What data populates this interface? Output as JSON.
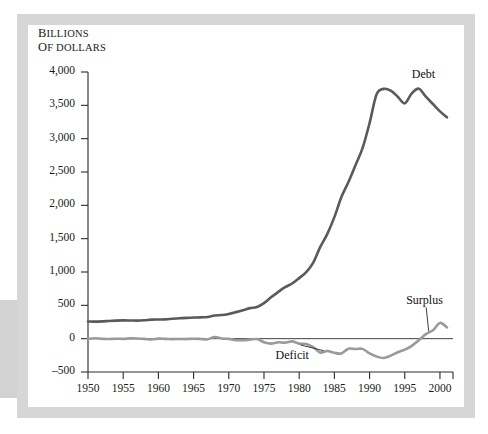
{
  "figure": {
    "frame_color": "#d6d6d6",
    "background_color": "#ffffff"
  },
  "chart_data": {
    "type": "line",
    "title": "",
    "subtitle": "",
    "ylabel_line1": "Billions",
    "ylabel_line2": "of dollars",
    "xlabel": "",
    "ylim": [
      -500,
      4000
    ],
    "xlim": [
      1950,
      2001
    ],
    "yticks": [
      -500,
      0,
      500,
      1000,
      1500,
      2000,
      2500,
      3000,
      3500,
      4000
    ],
    "ytick_labels": [
      "–500",
      "0",
      "500",
      "1,000",
      "1,500",
      "2,000",
      "2,500",
      "3,000",
      "3,500",
      "4,000"
    ],
    "xticks": [
      1950,
      1955,
      1960,
      1965,
      1970,
      1975,
      1980,
      1985,
      1990,
      1995,
      2000
    ],
    "xtick_labels": [
      "1950",
      "1955",
      "1960",
      "1965",
      "1970",
      "1975",
      "1980",
      "1985",
      "1990",
      "1995",
      "2000"
    ],
    "grid": false,
    "legend_position": "inline-annotations",
    "zero_reference_line": true,
    "annotations": [
      {
        "text": "Debt",
        "series": "Debt",
        "at_x": 1996,
        "at_y": 3950,
        "leader": false
      },
      {
        "text": "Surplus",
        "series": "Deficit and Surplus",
        "at_x": 1995.2,
        "at_y": 560,
        "leader": true
      },
      {
        "text": "Deficit",
        "series": "Deficit and Surplus",
        "at_x": 1977.5,
        "at_y": -255,
        "leader": true
      }
    ],
    "series": [
      {
        "name": "Debt",
        "color": "#5c5a58",
        "linewidth": 2.6,
        "x": [
          1950,
          1951,
          1952,
          1953,
          1954,
          1955,
          1956,
          1957,
          1958,
          1959,
          1960,
          1961,
          1962,
          1963,
          1964,
          1965,
          1966,
          1967,
          1968,
          1969,
          1970,
          1971,
          1972,
          1973,
          1974,
          1975,
          1976,
          1977,
          1978,
          1979,
          1980,
          1981,
          1982,
          1983,
          1984,
          1985,
          1986,
          1987,
          1988,
          1989,
          1990,
          1991,
          1992,
          1993,
          1994,
          1995,
          1996,
          1997,
          1998,
          1999,
          2000,
          2001
        ],
        "values": [
          257,
          255,
          259,
          266,
          271,
          274,
          273,
          271,
          276,
          285,
          287,
          289,
          298,
          306,
          312,
          317,
          320,
          326,
          348,
          354,
          371,
          398,
          427,
          458,
          475,
          533,
          620,
          699,
          772,
          827,
          908,
          998,
          1142,
          1377,
          1572,
          1823,
          2125,
          2350,
          2602,
          2857,
          3233,
          3665,
          3747,
          3720,
          3630,
          3530,
          3680,
          3750,
          3630,
          3520,
          3410,
          3320
        ]
      },
      {
        "name": "Deficit and Surplus",
        "color": "#9a9a9a",
        "linewidth": 2.6,
        "x": [
          1950,
          1951,
          1952,
          1953,
          1954,
          1955,
          1956,
          1957,
          1958,
          1959,
          1960,
          1961,
          1962,
          1963,
          1964,
          1965,
          1966,
          1967,
          1968,
          1969,
          1970,
          1971,
          1972,
          1973,
          1974,
          1975,
          1976,
          1977,
          1978,
          1979,
          1980,
          1981,
          1982,
          1983,
          1984,
          1985,
          1986,
          1987,
          1988,
          1989,
          1990,
          1991,
          1992,
          1993,
          1994,
          1995,
          1996,
          1997,
          1998,
          1999,
          2000,
          2001
        ],
        "values": [
          -3,
          6,
          -2,
          -6,
          -1,
          -3,
          4,
          3,
          -3,
          -13,
          0,
          -3,
          -7,
          -5,
          -6,
          -1,
          -4,
          -9,
          25,
          3,
          -3,
          -23,
          -23,
          -15,
          -6,
          -53,
          -74,
          -54,
          -59,
          -41,
          -74,
          -79,
          -128,
          -208,
          -185,
          -212,
          -221,
          -150,
          -155,
          -153,
          -221,
          -269,
          -290,
          -255,
          -203,
          -164,
          -107,
          -22,
          69,
          126,
          236,
          170
        ]
      }
    ]
  }
}
